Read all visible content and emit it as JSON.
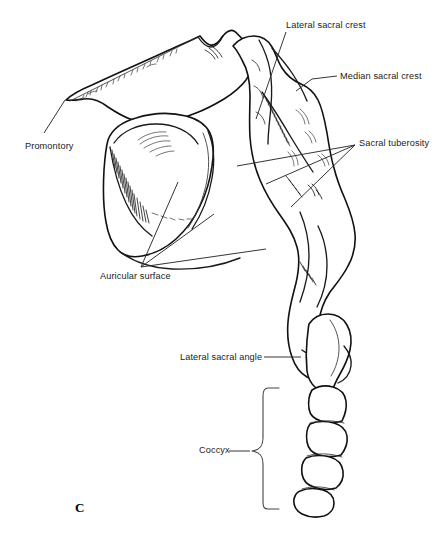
{
  "figure": {
    "panel_letter": "C",
    "background_color": "#ffffff",
    "line_color": "#111111",
    "label_color": "#1b1b1b",
    "width": 447,
    "height": 543
  },
  "labels": [
    {
      "id": "lateral-sacral-crest",
      "text": "Lateral sacral crest",
      "x": 286,
      "y": 20,
      "align": "left"
    },
    {
      "id": "median-sacral-crest",
      "text": "Median sacral crest",
      "x": 340,
      "y": 71,
      "align": "left"
    },
    {
      "id": "sacral-tuberosity",
      "text": "Sacral tuberosity",
      "x": 359,
      "y": 138,
      "align": "left"
    },
    {
      "id": "promontory",
      "text": "Promontory",
      "x": 25,
      "y": 141,
      "align": "left"
    },
    {
      "id": "auricular-surface",
      "text": "Auricular surface",
      "x": 100,
      "y": 271,
      "align": "left"
    },
    {
      "id": "lateral-sacral-angle",
      "text": "Lateral sacral angle",
      "x": 180,
      "y": 352,
      "align": "left"
    },
    {
      "id": "coccyx",
      "text": "Coccyx",
      "x": 199,
      "y": 445,
      "align": "left"
    }
  ],
  "leader_lines": {
    "lateral_sacral_crest": "M286,32 L256,119",
    "median_sacral_crest": "M337,76 L312,79 L296,91",
    "sacral_tuberosity_fan": [
      "M355,145 L237,166",
      "M355,145 L266,184",
      "M355,145 L291,207"
    ],
    "promontory": "M65,100 L44,133",
    "auricular_surface_fan": [
      "M141,267 L178,182",
      "M141,267 L214,214",
      "M141,267 L266,249"
    ],
    "lateral_sacral_angle": "M264,357 L301,357",
    "coccyx_stem": "M229,451 L250,451"
  },
  "coccyx_brace": {
    "top_y": 388,
    "bottom_y": 509,
    "center_y": 451,
    "spine_x": 265,
    "tip_x": 279,
    "point_x": 252
  }
}
